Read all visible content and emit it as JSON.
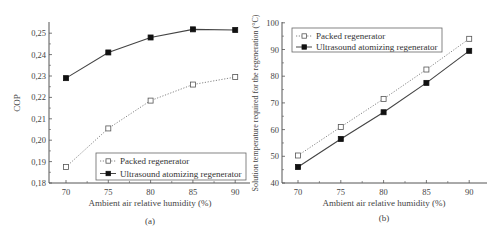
{
  "chart_data": [
    {
      "id": "a",
      "type": "line",
      "caption": "(a)",
      "title": "",
      "xlabel": "Ambient air relative humidity (%)",
      "ylabel": "COP",
      "x": [
        70,
        75,
        80,
        85,
        90
      ],
      "xticks": [
        "70",
        "75",
        "80",
        "85",
        "90"
      ],
      "yticks": [
        "0,18",
        "0,19",
        "0,20",
        "0,21",
        "0,22",
        "0,23",
        "0,24",
        "0,25"
      ],
      "ylim": [
        0.18,
        0.255
      ],
      "xlim": [
        68,
        92
      ],
      "grid": false,
      "legend_position": "lower right",
      "series": [
        {
          "name": "Packed regenerator",
          "marker": "open-square",
          "line": "dotted",
          "values": [
            0.1875,
            0.2055,
            0.2185,
            0.226,
            0.2295
          ]
        },
        {
          "name": "Ultrasound atomizing regenerator",
          "marker": "filled-square",
          "line": "solid",
          "values": [
            0.229,
            0.241,
            0.248,
            0.2518,
            0.2515
          ]
        }
      ]
    },
    {
      "id": "b",
      "type": "line",
      "caption": "(b)",
      "title": "",
      "xlabel": "Ambient air relative humidity (%)",
      "ylabel": "Solution temperature required for the regeneration (°C)",
      "x": [
        70,
        75,
        80,
        85,
        90
      ],
      "xticks": [
        "70",
        "75",
        "80",
        "85",
        "90"
      ],
      "yticks": [
        "40",
        "50",
        "60",
        "70",
        "80",
        "90",
        "100"
      ],
      "ylim": [
        40,
        100
      ],
      "xlim": [
        68,
        92
      ],
      "grid": false,
      "legend_position": "upper left",
      "series": [
        {
          "name": "Packed regenerator",
          "marker": "open-square",
          "line": "dotted",
          "values": [
            50.3,
            61,
            71.5,
            82.5,
            94
          ]
        },
        {
          "name": "Ultrasound atomizing regenerator",
          "marker": "filled-square",
          "line": "solid",
          "values": [
            46,
            56.5,
            66.5,
            77.5,
            89.5
          ]
        }
      ]
    }
  ]
}
